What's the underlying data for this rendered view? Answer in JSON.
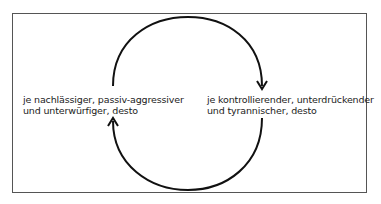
{
  "diagram": {
    "type": "cycle",
    "nodes": [
      {
        "id": "left",
        "lines": [
          "je nachlässiger, passiv-aggressiver",
          "und unterwürfiger, desto"
        ]
      },
      {
        "id": "right",
        "lines": [
          "je kontrollierender, unterdrückender",
          "und tyrannischer, desto"
        ]
      }
    ],
    "edges": [
      {
        "from": "left",
        "to": "right",
        "path": "top-arc",
        "direction": "clockwise"
      },
      {
        "from": "right",
        "to": "left",
        "path": "bottom-arc",
        "direction": "clockwise"
      }
    ],
    "colors": {
      "line": "#111111",
      "frame": "#555555",
      "text": "#222222"
    }
  }
}
